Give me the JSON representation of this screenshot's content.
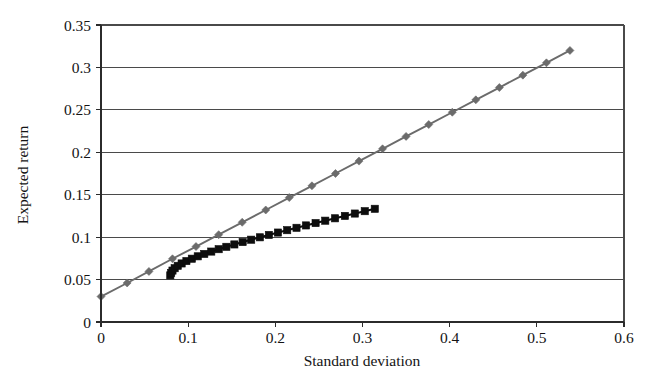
{
  "chart_data": {
    "type": "line",
    "title": "",
    "xlabel": "Standard deviation",
    "ylabel": "Expected return",
    "xlim": [
      0,
      0.6
    ],
    "ylim": [
      0,
      0.35
    ],
    "xticks": [
      "0",
      "0.1",
      "0.2",
      "0.3",
      "0.4",
      "0.5",
      "0.6"
    ],
    "xtick_values": [
      0,
      0.1,
      0.2,
      0.3,
      0.4,
      0.5,
      0.6
    ],
    "yticks": [
      "0",
      "0.05",
      "0.1",
      "0.15",
      "0.2",
      "0.25",
      "0.3",
      "0.35"
    ],
    "ytick_values": [
      0,
      0.05,
      0.1,
      0.15,
      0.2,
      0.25,
      0.3,
      0.35
    ],
    "grid": "horizontal",
    "legend": "none",
    "colors": {
      "capital_market_line": "#6b6b6b",
      "efficient_frontier": "#0d0d0d",
      "gridline": "#4a4a4a",
      "axis": "#2b2b2b",
      "background": "#ffffff"
    },
    "series": [
      {
        "name": "capital-market-line",
        "marker": "diamond",
        "color": "#6b6b6b",
        "x": [
          0,
          0.03,
          0.055,
          0.082,
          0.109,
          0.135,
          0.162,
          0.189,
          0.216,
          0.242,
          0.269,
          0.296,
          0.323,
          0.35,
          0.376,
          0.403,
          0.43,
          0.457,
          0.484,
          0.511,
          0.538
        ],
        "y": [
          0.03,
          0.046,
          0.0596,
          0.0745,
          0.0889,
          0.1029,
          0.1175,
          0.132,
          0.1466,
          0.1605,
          0.175,
          0.1896,
          0.2041,
          0.2187,
          0.2327,
          0.2472,
          0.2618,
          0.2763,
          0.2909,
          0.3054,
          0.32
        ]
      },
      {
        "name": "efficient-frontier",
        "marker": "square",
        "color": "#0d0d0d",
        "x": [
          0.0795,
          0.0805,
          0.082,
          0.0845,
          0.088,
          0.0925,
          0.098,
          0.1042,
          0.111,
          0.1185,
          0.1265,
          0.135,
          0.1438,
          0.153,
          0.1625,
          0.1723,
          0.1823,
          0.1926,
          0.203,
          0.2136,
          0.2243,
          0.2352,
          0.2462,
          0.2573,
          0.2685,
          0.2798,
          0.2912,
          0.3026,
          0.3141
        ],
        "y": [
          0.055,
          0.0578,
          0.0606,
          0.0634,
          0.0662,
          0.069,
          0.0718,
          0.0746,
          0.0774,
          0.0802,
          0.083,
          0.0858,
          0.0886,
          0.0914,
          0.0942,
          0.097,
          0.0998,
          0.1026,
          0.1054,
          0.1082,
          0.111,
          0.1138,
          0.1166,
          0.1194,
          0.1222,
          0.125,
          0.1278,
          0.1306,
          0.1334
        ]
      }
    ]
  }
}
